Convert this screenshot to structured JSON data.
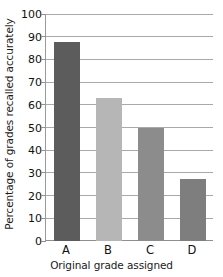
{
  "chart_data": {
    "type": "bar",
    "title": "",
    "categories": [
      "A",
      "B",
      "C",
      "D"
    ],
    "values": [
      87.5,
      63,
      50,
      27.5
    ],
    "series": [
      {
        "name": "Percentage of grades recalled accurately",
        "values": [
          87.5,
          63,
          50,
          27.5
        ]
      }
    ],
    "xlabel": "Original grade assigned",
    "ylabel": "Percentage of grades recalled accurately",
    "ylim": [
      0,
      100
    ],
    "ytick_step": 10,
    "ytick_labels": [
      "0",
      "10",
      "20",
      "30",
      "40",
      "50",
      "60",
      "70",
      "80",
      "90",
      "100"
    ],
    "ytick_values": [
      0,
      10,
      20,
      30,
      40,
      50,
      60,
      70,
      80,
      90,
      100
    ],
    "grid": "horizontal",
    "legend": "none",
    "bar_colors": [
      "#5c5c5c",
      "#b6b6b6",
      "#8c8c8c",
      "#7e7e7e"
    ],
    "background_color": "#ffffff",
    "gridline_color": "#a9a9a9",
    "axis_color": "#8f8f8f"
  },
  "axes": {
    "y_title": "Percentage of grades recalled accurately",
    "x_title": "Original grade assigned"
  }
}
